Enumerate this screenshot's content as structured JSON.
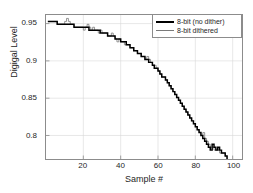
{
  "chart_data": {
    "type": "line",
    "title": "",
    "xlabel": "Sample #",
    "ylabel": "Digigal Level",
    "xlim": [
      0,
      105
    ],
    "ylim": [
      0.7685,
      0.9615
    ],
    "grid": true,
    "xticks": [
      20,
      40,
      60,
      80,
      100
    ],
    "xticklabels": [
      "20",
      "40",
      "60",
      "80",
      "100"
    ],
    "yticks": [
      0.8,
      0.85,
      0.9,
      0.95
    ],
    "yticklabels": [
      "0.8",
      "0.85",
      "0.9",
      "0.95"
    ],
    "legend": {
      "position": "top-right",
      "entries": [
        {
          "name": "8-bit (no dither)",
          "color": "#000000",
          "width": 2
        },
        {
          "name": "8-bit dithered",
          "color": "#7a7a7a",
          "width": 1
        }
      ]
    },
    "x": [
      1,
      2,
      3,
      4,
      5,
      6,
      7,
      8,
      9,
      10,
      11,
      12,
      13,
      14,
      15,
      16,
      17,
      18,
      19,
      20,
      21,
      22,
      23,
      24,
      25,
      26,
      27,
      28,
      29,
      30,
      31,
      32,
      33,
      34,
      35,
      36,
      37,
      38,
      39,
      40,
      41,
      42,
      43,
      44,
      45,
      46,
      47,
      48,
      49,
      50,
      51,
      52,
      53,
      54,
      55,
      56,
      57,
      58,
      59,
      60,
      61,
      62,
      63,
      64,
      65,
      66,
      67,
      68,
      69,
      70,
      71,
      72,
      73,
      74,
      75,
      76,
      77,
      78,
      79,
      80,
      81,
      82,
      83,
      84,
      85,
      86,
      87,
      88,
      89,
      90,
      91,
      92,
      93,
      94,
      95,
      96,
      97
    ],
    "series": [
      {
        "name": "8-bit (no dither)",
        "color": "#000000",
        "values": [
          0.9529,
          0.9529,
          0.9529,
          0.9529,
          0.9529,
          0.949,
          0.949,
          0.949,
          0.949,
          0.949,
          0.949,
          0.949,
          0.949,
          0.949,
          0.9451,
          0.9451,
          0.9451,
          0.9451,
          0.9451,
          0.9451,
          0.9451,
          0.9451,
          0.9412,
          0.9412,
          0.9412,
          0.9412,
          0.9412,
          0.9412,
          0.9373,
          0.9373,
          0.9373,
          0.9373,
          0.9333,
          0.9333,
          0.9333,
          0.9333,
          0.9294,
          0.9294,
          0.9294,
          0.9255,
          0.9255,
          0.9255,
          0.9216,
          0.9216,
          0.9176,
          0.9176,
          0.9137,
          0.9137,
          0.9098,
          0.9098,
          0.9059,
          0.9059,
          0.902,
          0.902,
          0.898,
          0.898,
          0.8941,
          0.8902,
          0.8902,
          0.8863,
          0.8824,
          0.8784,
          0.8784,
          0.8745,
          0.8706,
          0.8667,
          0.8627,
          0.8588,
          0.8549,
          0.851,
          0.8471,
          0.8431,
          0.8392,
          0.8353,
          0.8314,
          0.8275,
          0.8235,
          0.8196,
          0.8157,
          0.8118,
          0.8078,
          0.8039,
          0.8,
          0.7961,
          0.7922,
          0.7882,
          0.7843,
          0.7804,
          0.7882,
          0.7843,
          0.7804,
          0.7843,
          0.7804,
          0.7765,
          0.7765,
          0.7725,
          0.7686
        ]
      },
      {
        "name": "8-bit dithered",
        "color": "#7a7a7a",
        "values": [
          0.9529,
          0.9529,
          0.9529,
          0.9529,
          0.9529,
          0.949,
          0.949,
          0.949,
          0.949,
          0.9529,
          0.9569,
          0.9529,
          0.949,
          0.949,
          0.9451,
          0.9451,
          0.9451,
          0.9451,
          0.9451,
          0.9412,
          0.9451,
          0.949,
          0.9451,
          0.9412,
          0.9451,
          0.9412,
          0.9412,
          0.9373,
          0.9412,
          0.9373,
          0.9373,
          0.9373,
          0.9333,
          0.9333,
          0.9373,
          0.9333,
          0.9294,
          0.9255,
          0.9294,
          0.9255,
          0.9255,
          0.9216,
          0.9216,
          0.9216,
          0.9176,
          0.9176,
          0.9137,
          0.9137,
          0.9098,
          0.9098,
          0.9059,
          0.9059,
          0.902,
          0.9059,
          0.902,
          0.898,
          0.8941,
          0.8941,
          0.8902,
          0.8863,
          0.8824,
          0.8784,
          0.8784,
          0.8745,
          0.8706,
          0.8667,
          0.8627,
          0.8588,
          0.8549,
          0.851,
          0.8471,
          0.8431,
          0.8392,
          0.8353,
          0.8314,
          0.8275,
          0.8235,
          0.8196,
          0.8157,
          0.8118,
          0.8078,
          0.8039,
          0.8,
          0.8039,
          0.7961,
          0.7922,
          0.7882,
          0.7843,
          0.7843,
          0.7804,
          0.7804,
          0.7804,
          0.7765,
          0.7765,
          0.7765,
          0.7725,
          0.7686
        ]
      }
    ]
  }
}
